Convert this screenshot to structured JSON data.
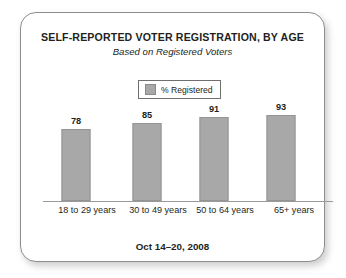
{
  "card": {
    "border_color": "#8e8e8e",
    "background": "#ffffff"
  },
  "header": {
    "title": "SELF-REPORTED VOTER REGISTRATION, BY AGE",
    "subtitle": "Based on Registered Voters"
  },
  "legend": {
    "entries": [
      {
        "label": "% Registered",
        "color": "#a8a8a8"
      }
    ]
  },
  "footer": {
    "date_range": "Oct 14–20, 2008"
  },
  "chart_data": {
    "type": "bar",
    "title": "SELF-REPORTED VOTER REGISTRATION, BY AGE",
    "subtitle": "Based on Registered Voters",
    "xlabel": "",
    "ylabel": "% Registered",
    "ylim": [
      0,
      100
    ],
    "grid": false,
    "legend_position": "top-center",
    "axis_color": "#9a9a9a",
    "bar_color": "#a8a8a8",
    "categories": [
      "18 to 29 years",
      "30 to 49 years",
      "50 to 64 years",
      "65+ years"
    ],
    "series": [
      {
        "name": "% Registered",
        "values": [
          78,
          85,
          91,
          93
        ]
      }
    ],
    "annotation": "Oct 14–20, 2008"
  }
}
